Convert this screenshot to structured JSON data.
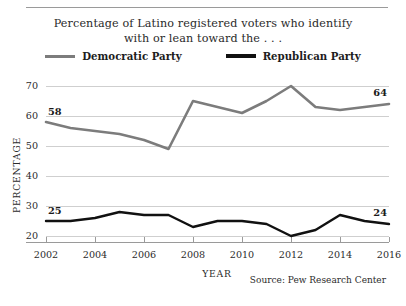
{
  "chart_data": {
    "type": "line",
    "title": "Percentage of Latino registered voters who identify with or lean toward the . . .",
    "title_lines": [
      "Percentage of Latino registered voters who identify",
      "with or lean toward the . . ."
    ],
    "xlabel": "YEAR",
    "ylabel": "PERCENTAGE",
    "xlim": [
      2002,
      2016
    ],
    "ylim": [
      18,
      72
    ],
    "ytick_values": [
      20,
      30,
      40,
      50,
      60,
      70
    ],
    "ytick_labels": [
      "20",
      "30",
      "40",
      "50",
      "60",
      "70"
    ],
    "xtick_values": [
      2002,
      2004,
      2006,
      2008,
      2010,
      2012,
      2014,
      2016
    ],
    "xtick_labels": [
      "2002",
      "2004",
      "2006",
      "2008",
      "2010",
      "2012",
      "2014",
      "2016"
    ],
    "grid": true,
    "legend_position": "top-center",
    "x": [
      2002,
      2003,
      2004,
      2005,
      2006,
      2007,
      2008,
      2009,
      2010,
      2011,
      2012,
      2013,
      2014,
      2015,
      2016
    ],
    "series": [
      {
        "name": "Democratic Party",
        "color": "#7c7c7c",
        "values": [
          58,
          56,
          55,
          54,
          52,
          49,
          65,
          63,
          61,
          65,
          70,
          63,
          62,
          63,
          64
        ],
        "endpoint_labels": {
          "first": "58",
          "last": "64"
        }
      },
      {
        "name": "Republican Party",
        "color": "#111111",
        "values": [
          25,
          25,
          26,
          28,
          27,
          27,
          23,
          25,
          25,
          24,
          20,
          22,
          27,
          25,
          24
        ],
        "endpoint_labels": {
          "first": "25",
          "last": "24"
        }
      }
    ],
    "annotations": [
      {
        "text": "58",
        "series": "Democratic Party",
        "x": 2002
      },
      {
        "text": "64",
        "series": "Democratic Party",
        "x": 2016
      },
      {
        "text": "25",
        "series": "Republican Party",
        "x": 2002
      },
      {
        "text": "24",
        "series": "Republican Party",
        "x": 2016
      }
    ],
    "source": "Source:  Pew Research Center"
  },
  "legend": {
    "items": [
      {
        "label": "Democratic Party"
      },
      {
        "label": "Republican Party"
      }
    ]
  }
}
